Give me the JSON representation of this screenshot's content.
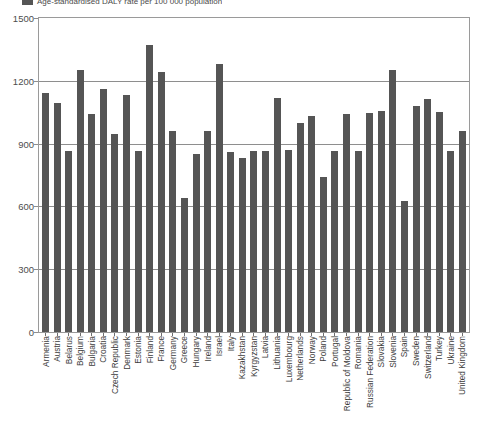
{
  "chart_data": {
    "type": "bar",
    "title": "",
    "legend": {
      "position": "top-left",
      "entries": [
        {
          "label": "Age-standardised DALY rate per 100 000 population",
          "color": "#555555"
        }
      ]
    },
    "xlabel": "",
    "ylabel": "",
    "ylim": [
      0,
      1500
    ],
    "yticks": [
      0,
      300,
      600,
      900,
      1200,
      1500
    ],
    "ytick_labels": [
      "0",
      "300",
      "600",
      "900",
      "1200",
      "1500"
    ],
    "grid": true,
    "categories": [
      "Armenia",
      "Austria",
      "Belarus",
      "Belgium",
      "Bulgaria",
      "Croatia",
      "Czech Republic",
      "Denmark",
      "Estonia",
      "Finland",
      "France",
      "Germany",
      "Greece",
      "Hungary",
      "Ireland",
      "Israel",
      "Italy",
      "Kazakhstan",
      "Kyrgyzstan",
      "Latvia",
      "Lithuania",
      "Luxembourg",
      "Netherlands",
      "Norway",
      "Poland",
      "Portugal",
      "Republic of Moldova",
      "Romania",
      "Russian Federation",
      "Slovakia",
      "Slovenia",
      "Spain",
      "Sweden",
      "Switzerland",
      "Turkey",
      "Ukraine",
      "United Kingdom"
    ],
    "values": [
      1140,
      1095,
      865,
      1250,
      1040,
      1160,
      945,
      1130,
      865,
      1370,
      1240,
      960,
      640,
      850,
      960,
      1280,
      860,
      830,
      865,
      865,
      1120,
      870,
      1000,
      1030,
      740,
      865,
      1040,
      865,
      1045,
      1055,
      1250,
      625,
      1080,
      1115,
      1050,
      865,
      960
    ]
  },
  "colors": {
    "bar": "#555555",
    "grid": "#8e8e8e",
    "frame": "#9a9a9a",
    "text": "#3c3c3c"
  }
}
